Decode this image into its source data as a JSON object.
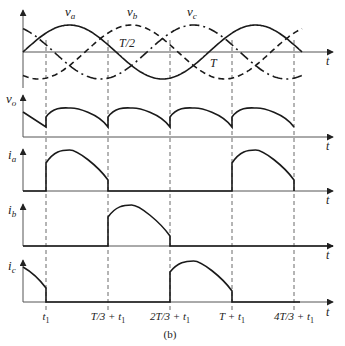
{
  "figure": {
    "caption": "(b)",
    "time_axis_label": "t",
    "period_label": "T",
    "half_period_label": "T/2"
  },
  "panels": [
    {
      "id": "phase-voltages",
      "labels": [
        "v_a",
        "v_b",
        "v_c"
      ],
      "label_text": {
        "va": "v",
        "va_sub": "a",
        "vb": "v",
        "vb_sub": "b",
        "vc": "v",
        "vc_sub": "c"
      }
    },
    {
      "id": "vo",
      "label": "v",
      "sub": "o"
    },
    {
      "id": "ia",
      "label": "i",
      "sub": "a"
    },
    {
      "id": "ib",
      "label": "i",
      "sub": "b"
    },
    {
      "id": "ic",
      "label": "i",
      "sub": "c"
    }
  ],
  "time_markers": [
    {
      "label": "t",
      "sub": "1"
    },
    {
      "label": "T/3 + t",
      "sub": "1"
    },
    {
      "label": "2T/3 + t",
      "sub": "1"
    },
    {
      "label": "T + t",
      "sub": "1"
    },
    {
      "label": "4T/3 + t",
      "sub": "1"
    }
  ],
  "legend_styles": {
    "v_a": "solid",
    "v_b": "dashed",
    "v_c": "dash-dot"
  }
}
